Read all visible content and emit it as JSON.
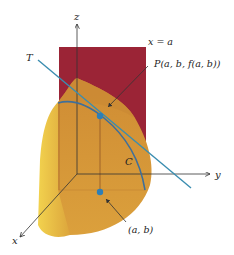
{
  "figure": {
    "labels": {
      "z_axis": "z",
      "y_axis": "y",
      "x_axis": "x",
      "plane": "x = a",
      "tangent": "T",
      "point_p": "P(a, b, f(a, b))",
      "curve": "C",
      "base_point": "(a, b)"
    },
    "colors": {
      "plane": "#9b2436",
      "surface_front": "#d99b3a",
      "surface_side": "#e9c048",
      "surface_top": "#c98a33",
      "tangent_line": "#3a8db0",
      "curve": "#3f6f9a",
      "point": "#2d7fb8",
      "axis": "#333333"
    }
  }
}
